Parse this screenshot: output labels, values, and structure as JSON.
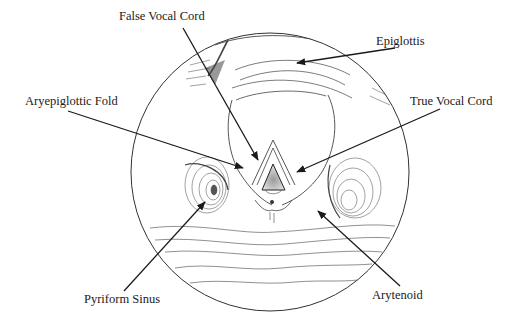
{
  "diagram": {
    "style": {
      "ink": "#1a1a1a",
      "hatch": "#444444",
      "background": "#ffffff"
    },
    "labels": [
      {
        "id": "false-vocal-cord",
        "text": "False Vocal Cord",
        "x": 119,
        "y": 12
      },
      {
        "id": "epiglottis",
        "text": "Epiglottis",
        "x": 376,
        "y": 37
      },
      {
        "id": "aryepiglottic-fold",
        "text": "Aryepiglottic Fold",
        "x": 25,
        "y": 96
      },
      {
        "id": "true-vocal-cord",
        "text": "True Vocal Cord",
        "x": 410,
        "y": 96
      },
      {
        "id": "pyriform-sinus",
        "text": "Pyriform Sinus",
        "x": 84,
        "y": 294
      },
      {
        "id": "arytenoid",
        "text": "Arytenoid",
        "x": 372,
        "y": 290
      }
    ]
  }
}
